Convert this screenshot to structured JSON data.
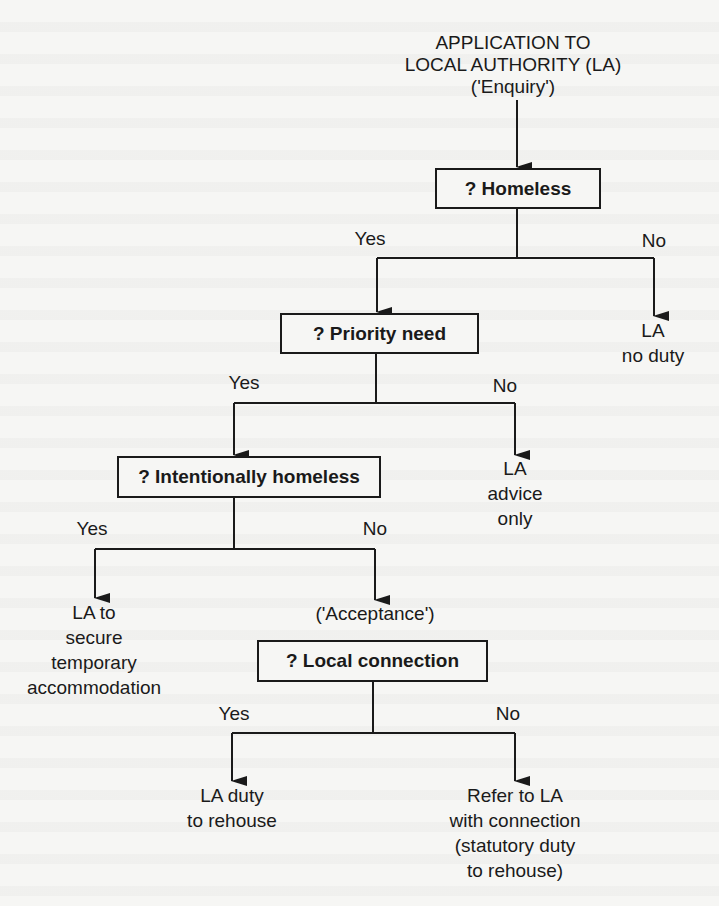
{
  "diagram": {
    "type": "flowchart",
    "start": {
      "lines": [
        "APPLICATION TO",
        "LOCAL AUTHORITY (LA)",
        "('Enquiry')"
      ]
    },
    "decisions": [
      {
        "id": "homeless",
        "label": "? Homeless"
      },
      {
        "id": "priority",
        "label": "? Priority need"
      },
      {
        "id": "intentional",
        "label": "? Intentionally homeless"
      },
      {
        "id": "local",
        "label": "? Local connection"
      }
    ],
    "branch_labels": {
      "yes": "Yes",
      "no": "No"
    },
    "outcomes": {
      "no_duty": [
        "LA",
        "no duty"
      ],
      "advice_only": [
        "LA",
        "advice",
        "only"
      ],
      "temporary": [
        "LA to",
        "secure",
        "temporary",
        "accommodation"
      ],
      "acceptance": "('Acceptance')",
      "duty_rehouse": [
        "LA duty",
        "to rehouse"
      ],
      "refer": [
        "Refer to LA",
        "with connection",
        "(statutory duty",
        "to rehouse)"
      ]
    },
    "colors": {
      "ink": "#1a1a1a",
      "paper": "#f6f6f4"
    }
  }
}
